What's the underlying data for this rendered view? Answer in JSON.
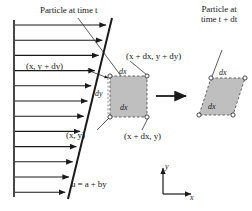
{
  "figure": {
    "type": "fluid-mechanics-shear-deformation-diagram",
    "background_color": "#ffffff",
    "line_color": "#1a1a1a",
    "element_fill_color": "#bfbfbf",
    "width": 252,
    "height": 211
  },
  "labels": {
    "particle_time_t": "Particle at time t",
    "particle_time_t_line1": "Particle at",
    "particle_time_t_line2": "time t + dt",
    "velocity_profile_equation": "u = a + by",
    "corner_bottom_left": "(x, y)",
    "corner_bottom_right": "(x + dx, y)",
    "corner_top_left": "(x, y + dy)",
    "corner_top_right": "(x + dx, y + dy)",
    "dx_top_left_square": "dx",
    "dx_bottom_left_square": "dx",
    "dy_left_square": "dy",
    "dx_top_right_shape": "dx",
    "dx_bottom_right_shape": "dx",
    "axis_x": "x",
    "axis_y": "y"
  },
  "velocity_profile": {
    "wall_x": 14,
    "wall_top_y": 20,
    "wall_bottom_y": 197,
    "arrow_count": 12,
    "arrow_start_y": 25,
    "arrow_spacing": 15.2,
    "profile_line_top": {
      "x": 112,
      "y": 18
    },
    "profile_line_bottom": {
      "x": 68,
      "y": 199
    }
  },
  "element_before": {
    "shape": "square",
    "x": 110,
    "y": 76,
    "width": 37,
    "height": 41,
    "border_style": "dashed",
    "corner_markers": 4
  },
  "element_after": {
    "shape": "parallelogram",
    "points": "211,78 245,78 233,115 199,115",
    "border_style": "dashed",
    "corner_markers": 4
  },
  "transition_arrow": {
    "from_x": 156,
    "to_x": 188,
    "y": 96
  },
  "axes": {
    "origin_x": 163,
    "origin_y": 194,
    "x_length": 28,
    "y_length": 28
  }
}
